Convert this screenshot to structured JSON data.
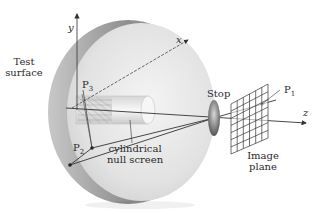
{
  "diagram": {
    "labels": {
      "test_surface_line1": "Test",
      "test_surface_line2": "surface",
      "axis_y": "y",
      "axis_x": "x",
      "axis_z": "z",
      "p3_main": "P",
      "p3_sub": "3",
      "p2_main": "P",
      "p2_sub": "2",
      "p1_main": "P",
      "p1_sub": "1",
      "cylinder_line1": "cylindrical",
      "cylinder_line2": "null screen",
      "stop": "Stop",
      "image_plane_line1": "Image",
      "image_plane_line2": "plane"
    },
    "colors": {
      "disk_face": "#e6e6e6",
      "disk_rim": "#9a9a9a",
      "line": "#3a3a3a",
      "stop": "#7a7a7a",
      "grid": "#333333"
    }
  }
}
